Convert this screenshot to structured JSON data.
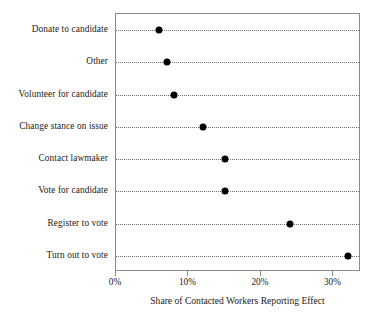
{
  "chart_data": {
    "type": "scatter",
    "title": "",
    "xlabel": "Share of Contacted Workers Reporting Effect",
    "ylabel": "",
    "categories": [
      "Donate to candidate",
      "Other",
      "Volunteer for candidate",
      "Change stance on issue",
      "Contact lawmaker",
      "Vote for candidate",
      "Register to vote",
      "Turn out to vote"
    ],
    "values": [
      6,
      7,
      8,
      12,
      15,
      15,
      24,
      32
    ],
    "value_unit": "percent",
    "xlim": [
      0,
      33.8
    ],
    "ylim": [
      0,
      8
    ],
    "xticks": [
      0,
      10,
      20,
      30
    ],
    "xticklabels": [
      "0%",
      "10%",
      "20%",
      "30%"
    ],
    "grid": true,
    "grid_axis": "y",
    "grid_style": "dotted",
    "legend": false,
    "marker": "circle",
    "marker_color": "#000000",
    "frame_color": "#8a8a8a"
  },
  "axis": {
    "x_title": "Share of Contacted Workers Reporting Effect"
  }
}
